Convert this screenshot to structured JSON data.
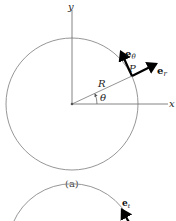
{
  "figure_a": {
    "caption": "(a)",
    "axes": {
      "x_label": "x",
      "y_label": "y"
    },
    "radius_label": "R",
    "angle_label": "θ",
    "point_label": "P",
    "vectors": [
      {
        "base": "e",
        "sub": "θ",
        "direction": "tangential"
      },
      {
        "base": "e",
        "sub": "r",
        "direction": "radial"
      }
    ]
  },
  "figure_b": {
    "vectors": [
      {
        "base": "e",
        "sub": "t",
        "direction": "tangential"
      }
    ]
  },
  "colors": {
    "circle": "#8a8a8a",
    "axes": "#555555",
    "vectors": "#000000"
  }
}
